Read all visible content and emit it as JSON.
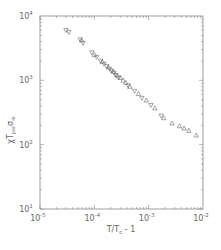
{
  "chart_data": {
    "type": "scatter",
    "title": "",
    "xlabel": "T/T_c - 1",
    "ylabel": "χT_{per}σ_{in}",
    "xscale": "log",
    "yscale": "log",
    "xlim": [
      1e-05,
      0.01
    ],
    "ylim": [
      10,
      10000
    ],
    "grid": false,
    "legend": null,
    "x_ticks": [
      {
        "value": 1e-05,
        "label": "10",
        "exp": "-5"
      },
      {
        "value": 0.0001,
        "label": "10",
        "exp": "-4"
      },
      {
        "value": 0.001,
        "label": "10",
        "exp": "-3"
      },
      {
        "value": 0.01,
        "label": "10",
        "exp": "-2"
      }
    ],
    "y_ticks": [
      {
        "value": 10,
        "label": "10",
        "exp": "1"
      },
      {
        "value": 100,
        "label": "10",
        "exp": "2"
      },
      {
        "value": 1000,
        "label": "10",
        "exp": "3"
      },
      {
        "value": 10000,
        "label": "10",
        "exp": "4"
      }
    ],
    "series": [
      {
        "name": "down-triangles",
        "marker": "triangle-down",
        "x": [
          3e-05,
          3.4e-05,
          5.5e-05,
          6.2e-05,
          9e-05,
          0.00011,
          0.00013,
          0.00015,
          0.00017,
          0.00019,
          0.00021,
          0.00023,
          0.00025,
          0.00028,
          0.00042,
          0.00055,
          0.00075,
          0.0011,
          0.0017
        ],
        "y": [
          6000,
          5600,
          4300,
          3800,
          2700,
          2300,
          2000,
          1800,
          1650,
          1500,
          1400,
          1300,
          1200,
          1100,
          830,
          680,
          530,
          410,
          280
        ]
      },
      {
        "name": "up-triangles",
        "marker": "triangle-up",
        "x": [
          5.8e-05,
          0.0001,
          0.00014,
          0.00018,
          0.00022,
          0.00026,
          0.0003,
          0.00034,
          0.00038,
          0.00045,
          0.00065,
          0.0009,
          0.0013,
          0.0019,
          0.0027,
          0.0037,
          0.0045,
          0.0055,
          0.0075
        ],
        "y": [
          4200,
          2500,
          1950,
          1600,
          1380,
          1200,
          1100,
          1000,
          920,
          800,
          620,
          490,
          370,
          260,
          215,
          195,
          180,
          165,
          140
        ]
      }
    ]
  },
  "axes": {
    "xlabel": "T/T",
    "xlabel_sub": "c",
    "xlabel_suffix": " - 1",
    "ylabel_main": "χT",
    "ylabel_sub": "per",
    "ylabel_sigma": "σ",
    "ylabel_sigma_sub": "in"
  }
}
